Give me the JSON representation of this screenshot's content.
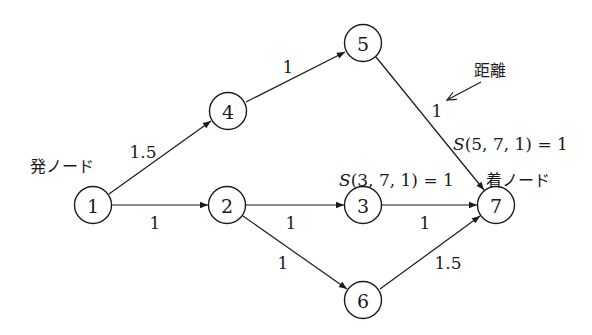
{
  "diagram": {
    "type": "directed-network",
    "nodes": [
      {
        "id": "1",
        "label": "1",
        "x": 93,
        "y": 205
      },
      {
        "id": "2",
        "label": "2",
        "x": 227,
        "y": 205
      },
      {
        "id": "3",
        "label": "3",
        "x": 363,
        "y": 205
      },
      {
        "id": "4",
        "label": "4",
        "x": 228,
        "y": 111
      },
      {
        "id": "5",
        "label": "5",
        "x": 363,
        "y": 43
      },
      {
        "id": "6",
        "label": "6",
        "x": 363,
        "y": 300
      },
      {
        "id": "7",
        "label": "7",
        "x": 496,
        "y": 205
      }
    ],
    "edges": [
      {
        "from": "1",
        "to": "4",
        "weight": "1.5"
      },
      {
        "from": "1",
        "to": "2",
        "weight": "1"
      },
      {
        "from": "4",
        "to": "5",
        "weight": "1"
      },
      {
        "from": "5",
        "to": "7",
        "weight": "1"
      },
      {
        "from": "2",
        "to": "3",
        "weight": "1"
      },
      {
        "from": "2",
        "to": "6",
        "weight": "1"
      },
      {
        "from": "3",
        "to": "7",
        "weight": "1"
      },
      {
        "from": "6",
        "to": "7",
        "weight": "1.5"
      }
    ],
    "labels": {
      "source_node": "発ノード",
      "sink_node": "着ノード",
      "distance": "距離",
      "s_3_7": "S(3, 7, 1) = 1",
      "s_5_7": "S(5, 7, 1) = 1"
    },
    "s_3_7_parts": {
      "fn": "S",
      "args": "(3, 7, 1) = 1"
    },
    "s_5_7_parts": {
      "fn": "S",
      "args": "(5, 7, 1) = 1"
    },
    "colors": {
      "ink": "#1a1a1a",
      "background": "#ffffff"
    }
  }
}
